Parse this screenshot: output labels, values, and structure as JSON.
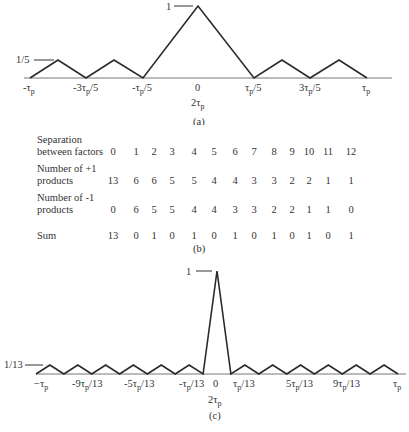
{
  "chart_data": [
    {
      "type": "line",
      "panel": "(a)",
      "title": "",
      "peak_label": "1",
      "sidelobe_label": "1/5",
      "xtick_labels": [
        "-τp",
        "-3τp/5",
        "-τp/5",
        "0",
        "τp/5",
        "3τp/5",
        "τp"
      ],
      "xlabel_below_center": "2τp",
      "x": [
        -1,
        -0.8,
        -0.6,
        -0.4,
        -0.2,
        0,
        0.2,
        0.4,
        0.6,
        0.8,
        1
      ],
      "values": [
        0,
        0.2,
        0,
        0.2,
        0,
        1,
        0,
        0.2,
        0,
        0.2,
        0
      ],
      "xlim": [
        -1,
        1
      ],
      "ylim": [
        0,
        1
      ],
      "grid": false
    },
    {
      "type": "table",
      "panel": "(b)",
      "row_headers": [
        "Separation between factors",
        "Number of +1 products",
        "Number of -1 products",
        "Sum"
      ],
      "columns": [
        0,
        1,
        2,
        3,
        4,
        5,
        6,
        7,
        8,
        9,
        10,
        11,
        12
      ],
      "rows": [
        [
          0,
          1,
          2,
          3,
          4,
          5,
          6,
          7,
          8,
          9,
          10,
          11,
          12
        ],
        [
          13,
          6,
          6,
          5,
          5,
          4,
          4,
          3,
          3,
          2,
          2,
          1,
          1
        ],
        [
          0,
          6,
          5,
          5,
          4,
          4,
          3,
          3,
          2,
          2,
          1,
          1,
          0
        ],
        [
          13,
          0,
          1,
          0,
          1,
          0,
          1,
          0,
          1,
          0,
          1,
          0,
          1
        ]
      ]
    },
    {
      "type": "line",
      "panel": "(c)",
      "title": "",
      "peak_label": "1",
      "sidelobe_label": "1/13",
      "xtick_labels": [
        "−τp",
        "-9τp/13",
        "-5τp/13",
        "-τp/13",
        "0",
        "τp/13",
        "5τp/13",
        "9τp/13",
        "τp"
      ],
      "xlabel_below_center": "2τp",
      "x": [
        -1,
        -0.923,
        -0.846,
        -0.769,
        -0.692,
        -0.615,
        -0.538,
        -0.462,
        -0.385,
        -0.308,
        -0.231,
        -0.154,
        -0.077,
        0,
        0.077,
        0.154,
        0.231,
        0.308,
        0.385,
        0.462,
        0.538,
        0.615,
        0.692,
        0.769,
        0.846,
        0.923,
        1
      ],
      "values": [
        0,
        0.077,
        0,
        0.077,
        0,
        0.077,
        0,
        0.077,
        0,
        0.077,
        0,
        0.077,
        0,
        1,
        0,
        0.077,
        0,
        0.077,
        0,
        0.077,
        0,
        0.077,
        0,
        0.077,
        0,
        0.077,
        0
      ],
      "xlim": [
        -1,
        1
      ],
      "ylim": [
        0,
        1
      ],
      "grid": false
    }
  ],
  "panel_a": {
    "peak_label": "1",
    "sidelobe_label": "1/5",
    "ticks": [
      {
        "base": "-τ",
        "sub": "p",
        "tail": ""
      },
      {
        "base": "-3τ",
        "sub": "p",
        "tail": "/5"
      },
      {
        "base": "-τ",
        "sub": "p",
        "tail": "/5"
      },
      {
        "base": "0",
        "sub": "",
        "tail": ""
      },
      {
        "base": "τ",
        "sub": "p",
        "tail": "/5"
      },
      {
        "base": "3τ",
        "sub": "p",
        "tail": "/5"
      },
      {
        "base": "τ",
        "sub": "p",
        "tail": ""
      }
    ],
    "center_below": {
      "base": "2τ",
      "sub": "p"
    },
    "caption": "(a)"
  },
  "panel_b": {
    "labels": {
      "sep_1": "Separation",
      "sep_2": "between factors",
      "plus_1": "Number of +1",
      "plus_2": "products",
      "minus_1": "Number of -1",
      "minus_2": "products",
      "sum": "Sum"
    },
    "caption": "(b)"
  },
  "panel_c": {
    "peak_label": "1",
    "sidelobe_label": "1/13",
    "ticks": [
      {
        "base": "−τ",
        "sub": "p",
        "tail": ""
      },
      {
        "base": "-9τ",
        "sub": "p",
        "tail": "/13"
      },
      {
        "base": "-5τ",
        "sub": "p",
        "tail": "/13"
      },
      {
        "base": "-τ",
        "sub": "p",
        "tail": "/13"
      },
      {
        "base": "0",
        "sub": "",
        "tail": ""
      },
      {
        "base": "τ",
        "sub": "p",
        "tail": "/13"
      },
      {
        "base": "5τ",
        "sub": "p",
        "tail": "/13"
      },
      {
        "base": "9τ",
        "sub": "p",
        "tail": "/13"
      },
      {
        "base": "τ",
        "sub": "p",
        "tail": ""
      }
    ],
    "center_below": {
      "base": "2τ",
      "sub": "p"
    },
    "caption": "(c)"
  },
  "colors": {
    "line": "#2a2a2a",
    "text": "#333333",
    "background": "#ffffff"
  }
}
